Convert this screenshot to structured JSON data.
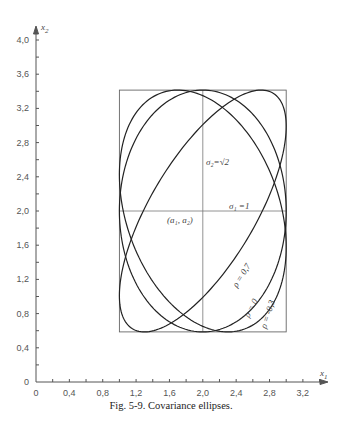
{
  "chart_data": {
    "type": "line",
    "title": "Covariance ellipses",
    "xlabel": "x1",
    "ylabel": "x2",
    "xlim": [
      0,
      3.4
    ],
    "ylim": [
      0,
      4.0
    ],
    "grid": false,
    "x_ticks": [
      "0",
      "0,4",
      "0,8",
      "1,2",
      "1,6",
      "2,0",
      "2,4",
      "2,8",
      "3,2"
    ],
    "x_tick_values": [
      0,
      0.4,
      0.8,
      1.2,
      1.6,
      2.0,
      2.4,
      2.8,
      3.2
    ],
    "y_ticks": [
      "0",
      "0,4",
      "0,8",
      "1,2",
      "1,6",
      "2,0",
      "2,4",
      "2,8",
      "3,2",
      "3,6",
      "4,0"
    ],
    "y_tick_values": [
      0,
      0.4,
      0.8,
      1.2,
      1.6,
      2.0,
      2.4,
      2.8,
      3.2,
      3.6,
      4.0
    ],
    "center": {
      "a1": 2.0,
      "a2": 2.0,
      "label": "(a1, a2)"
    },
    "sigma1": 1.0,
    "sigma2": 1.414,
    "bounding_box": {
      "x": [
        1.0,
        3.0
      ],
      "y": [
        0.586,
        3.414
      ]
    },
    "series": [
      {
        "name": "ρ = 0,7",
        "rho": 0.7
      },
      {
        "name": "ρ = 0",
        "rho": 0.0
      },
      {
        "name": "ρ = -0,3",
        "rho": -0.3
      }
    ],
    "annotations": [
      {
        "text": "σ2 = √2"
      },
      {
        "text": "σ1 = 1"
      }
    ]
  },
  "axes": {
    "x_label": "x",
    "x_sub": "1",
    "y_label": "x",
    "y_sub": "2"
  },
  "labels": {
    "center": "(a₁, a₂)",
    "sigma2": "σ₂=√2",
    "sigma1": "σ₁ =1",
    "rho1": "ρ = 0,7",
    "rho2": "ρ = 0",
    "rho3": "ρ = -0,3"
  },
  "caption": "Fig. 5-9.  Covariance ellipses."
}
